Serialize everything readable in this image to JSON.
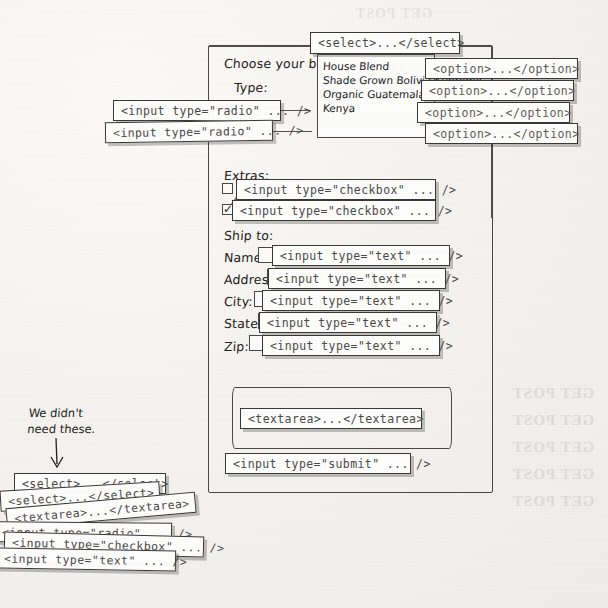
{
  "page": {
    "paper_color": "#f4f3f0",
    "ink_color": "#232222",
    "code_color": "#4b4a48"
  },
  "form": {
    "labels": {
      "choose_beans": "Choose your beans:",
      "type": "Type:",
      "extras": "Extras:",
      "ship_to": "Ship to:",
      "name": "Name:",
      "address": "Address:",
      "city": "City:",
      "state": "State:",
      "zip": "Zip:"
    },
    "select_options": [
      "House Blend",
      "Shade Grown Bolivia Supremo",
      "Organic Guatemala",
      "Kenya"
    ]
  },
  "callouts": {
    "select_tag": "<select>...</select>",
    "option_tag": "<option>...</option>",
    "options": [
      "<option>...</option>",
      "<option>...</option>",
      "<option>...</option>",
      "<option>...</option>"
    ],
    "radio_1": "<input type=\"radio\" ... />",
    "radio_2": "<input type=\"radio\" ... />",
    "checkbox_1": "<input type=\"checkbox\" ... />",
    "checkbox_2": "<input type=\"checkbox\" ... />",
    "text_name": "<input type=\"text\" ... />",
    "text_address": "<input type=\"text\" ... />",
    "text_city": "<input type=\"text\" ... />",
    "text_state": "<input type=\"text\" ... />",
    "text_zip": "<input type=\"text\" ... />",
    "textarea": "<textarea>...</textarea>",
    "submit": "<input type=\"submit\" ... />"
  },
  "annotation": {
    "note_line_1": "We didn't",
    "note_line_2": "need these.",
    "arrow": "down-arrow"
  },
  "leftovers": [
    {
      "text": "<select>...</select>",
      "rotation": "0deg"
    },
    {
      "text": "<select>...</select>",
      "rotation": "-3.5deg"
    },
    {
      "text": "<textarea>...</textarea>",
      "rotation": "-5deg"
    },
    {
      "text": "<input type=\"radio\" ... />",
      "rotation": "0.5deg"
    },
    {
      "text": "<input type=\"checkbox\" ... />",
      "rotation": "1.5deg"
    },
    {
      "text": "<input type=\"text\" ... />",
      "rotation": "1deg"
    }
  ],
  "bleed_through": [
    "GET  POST",
    "GET  POST",
    "GET  POST",
    "GET  POST",
    "GET  POST"
  ]
}
